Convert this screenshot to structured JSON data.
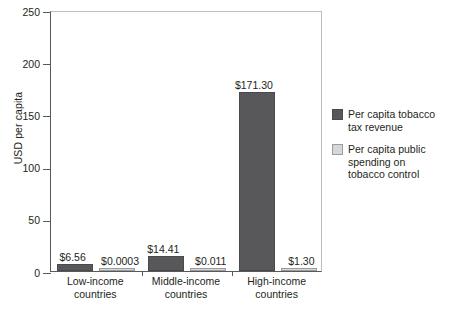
{
  "chart_data": {
    "type": "bar",
    "title": "",
    "xlabel": "",
    "ylabel": "USD per capita",
    "ylim": [
      0,
      250
    ],
    "yticks": [
      0,
      50,
      100,
      150,
      200,
      250
    ],
    "ytick_labels": [
      "0",
      "50",
      "100",
      "150",
      "200",
      "250"
    ],
    "grid": false,
    "legend_position": "right",
    "categories": [
      "Low-income countries",
      "Middle-income countries",
      "High-income countries"
    ],
    "category_lines": [
      [
        "Low-income",
        "countries"
      ],
      [
        "Middle-income",
        "countries"
      ],
      [
        "High-income",
        "countries"
      ]
    ],
    "series": [
      {
        "name": "Per capita tobacco tax revenue",
        "legend_lines": [
          "Per capita tobacco",
          "tax revenue"
        ],
        "color": "#58585a",
        "values": [
          6.56,
          14.41,
          171.3
        ],
        "data_labels": [
          "$6.56",
          "$14.41",
          "$171.30"
        ]
      },
      {
        "name": "Per capita public spending on tobacco control",
        "legend_lines": [
          "Per capita public",
          "spending on",
          "tobacco control"
        ],
        "color": "#d6d7d8",
        "values": [
          0.0003,
          0.011,
          1.3
        ],
        "data_labels": [
          "$0.0003",
          "$0.011",
          "$1.30"
        ]
      }
    ]
  },
  "colors": {
    "series_dark": "#58585a",
    "series_light": "#d6d7d8",
    "axis": "#58595b",
    "frame_light": "#bcbdc0",
    "text": "#231f20",
    "background": "#ffffff"
  }
}
